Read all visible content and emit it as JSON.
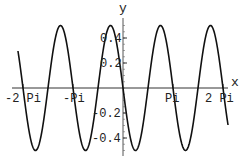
{
  "chart_data": {
    "type": "line",
    "title": "",
    "function": "-0.5*sin(2x)",
    "xlabel": "x",
    "ylabel": "y",
    "xlim": [
      -7.2,
      7.2
    ],
    "ylim": [
      -0.52,
      0.52
    ],
    "grid": false,
    "legend": null,
    "x_ticks": [
      {
        "value": -6.2832,
        "label": "-2 Pi"
      },
      {
        "value": -3.1416,
        "label": "-Pi"
      },
      {
        "value": 3.1416,
        "label": "Pi"
      },
      {
        "value": 6.2832,
        "label": "2 Pi"
      }
    ],
    "y_ticks": [
      {
        "value": 0.4,
        "label": "0.4"
      },
      {
        "value": 0.2,
        "label": "0.2"
      },
      {
        "value": -0.2,
        "label": "-0.2"
      },
      {
        "value": -0.4,
        "label": "-0.4"
      }
    ],
    "series": [
      {
        "name": "y = -0.5 sin(2x)",
        "color": "#111111",
        "x": [
          -6.2832,
          -5.4978,
          -4.7124,
          -3.927,
          -3.1416,
          -2.3562,
          -1.5708,
          -0.7854,
          0,
          0.7854,
          1.5708,
          2.3562,
          3.1416,
          3.927,
          4.7124,
          5.4978,
          6.2832
        ],
        "values": [
          0,
          -0.5,
          0,
          0.5,
          0,
          -0.5,
          0,
          0.5,
          0,
          -0.5,
          0,
          0.5,
          0,
          -0.5,
          0,
          0.5,
          0
        ]
      }
    ]
  },
  "labels": {
    "x_axis": "x",
    "y_axis": "y",
    "xt0": "-2 Pi",
    "xt1": "-Pi",
    "xt2": "Pi",
    "xt3": "2 Pi",
    "yt0": "0.4",
    "yt1": "0.2",
    "yt2": "-0.2",
    "yt3": "-0.4"
  }
}
